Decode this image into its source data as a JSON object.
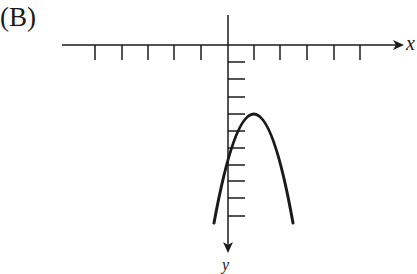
{
  "choice_label": "(B)",
  "axes": {
    "x_label": "x",
    "y_label": "y",
    "x_axis_direction": "right",
    "y_axis_direction": "down",
    "x_ticks_left": 5,
    "x_ticks_right": 5,
    "y_ticks_below_origin": 10
  },
  "curve": {
    "type": "parabola",
    "opens": "down",
    "vertex_approx_ticks": [
      1,
      3
    ],
    "description": "Downward-opening parabola with vertex right of the y-axis; y-axis drawn pointing downward"
  },
  "colors": {
    "stroke": "#1a1a1a",
    "background": "#ffffff"
  }
}
